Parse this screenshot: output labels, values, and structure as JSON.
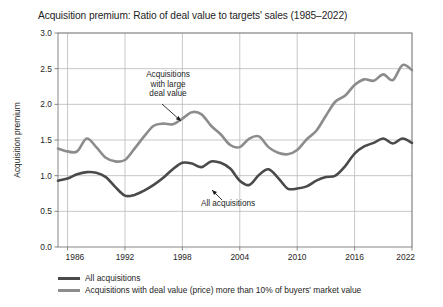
{
  "chart_data": {
    "type": "line",
    "title": "Acquisition premium: Ratio of deal value to targets' sales (1985–2022)",
    "xlabel": "",
    "ylabel": "Acquisition premium",
    "xlim": [
      1985,
      2022
    ],
    "ylim": [
      0.0,
      3.0
    ],
    "grid": true,
    "legend_position": "below",
    "xticks": [
      "1986",
      "1992",
      "1998",
      "2004",
      "2010",
      "2016",
      "2022"
    ],
    "xtick_values": [
      1986,
      1992,
      1998,
      2004,
      2010,
      2016,
      2022
    ],
    "yticks": [
      "0.0",
      "0.5",
      "1.0",
      "1.5",
      "2.0",
      "2.5",
      "3.0"
    ],
    "ytick_values": [
      0.0,
      0.5,
      1.0,
      1.5,
      2.0,
      2.5,
      3.0
    ],
    "x": [
      1985,
      1986,
      1987,
      1988,
      1989,
      1990,
      1991,
      1992,
      1993,
      1994,
      1995,
      1996,
      1997,
      1998,
      1999,
      2000,
      2001,
      2002,
      2003,
      2004,
      2005,
      2006,
      2007,
      2008,
      2009,
      2010,
      2011,
      2012,
      2013,
      2014,
      2015,
      2016,
      2017,
      2018,
      2019,
      2020,
      2021,
      2022
    ],
    "series": [
      {
        "name": "All acquisitions",
        "color": "#4a4a4a",
        "width": 2.6,
        "values": [
          0.93,
          0.96,
          1.02,
          1.05,
          1.04,
          0.98,
          0.84,
          0.72,
          0.73,
          0.79,
          0.87,
          0.97,
          1.09,
          1.18,
          1.17,
          1.12,
          1.2,
          1.18,
          1.1,
          0.93,
          0.87,
          1.01,
          1.09,
          0.97,
          0.82,
          0.82,
          0.85,
          0.93,
          0.98,
          1.0,
          1.13,
          1.31,
          1.41,
          1.46,
          1.52,
          1.45,
          1.52,
          1.46
        ]
      },
      {
        "name": "Acquisitions with deal value (price) more than 10% of buyers' market value",
        "color": "#8c8c8c",
        "width": 2.6,
        "values": [
          1.38,
          1.34,
          1.34,
          1.52,
          1.4,
          1.25,
          1.2,
          1.22,
          1.38,
          1.55,
          1.7,
          1.73,
          1.72,
          1.8,
          1.89,
          1.86,
          1.7,
          1.58,
          1.43,
          1.4,
          1.52,
          1.55,
          1.4,
          1.32,
          1.3,
          1.36,
          1.51,
          1.63,
          1.84,
          2.04,
          2.12,
          2.27,
          2.35,
          2.33,
          2.42,
          2.34,
          2.55,
          2.48
        ]
      }
    ],
    "annotations": [
      {
        "id": "annotation-large-deal-value",
        "lines": [
          "Acquisitions",
          "with large",
          "deal value"
        ],
        "text_x": 168,
        "text_y": 77,
        "arrow_from_x": 162,
        "arrow_from_y": 104,
        "arrow_to_x": 181,
        "arrow_to_y": 121
      },
      {
        "id": "annotation-all-acquisitions",
        "lines": [
          "All acquisitions"
        ],
        "text_x": 228,
        "text_y": 206,
        "arrow_from_x": 222,
        "arrow_from_y": 200,
        "arrow_to_x": 212,
        "arrow_to_y": 190
      }
    ],
    "legend": [
      {
        "label": "All acquisitions",
        "color": "#4a4a4a"
      },
      {
        "label": "Acquisitions with deal value (price) more than 10% of buyers' market value",
        "color": "#8c8c8c"
      }
    ],
    "colors": {
      "all_acquisitions": "#4a4a4a",
      "large_deal_value": "#8c8c8c",
      "grid": "#b9b9b9",
      "axis": "#7a7a7a",
      "text": "#1e1e1e",
      "background": "#ffffff"
    },
    "plot_box": {
      "left": 58,
      "right": 412,
      "top": 33,
      "bottom": 247
    }
  }
}
